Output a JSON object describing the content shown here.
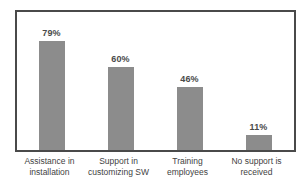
{
  "chart_data": {
    "type": "bar",
    "title": "",
    "subtitle": "",
    "xlabel": "",
    "ylabel": "",
    "ylim": [
      0,
      100
    ],
    "grid": false,
    "legend": false,
    "legend_position": "none",
    "orientation": "vertical",
    "bar_color": "#8c8c8c",
    "frame_color": "#4a4a4a",
    "background_color": "#ffffff",
    "label_color": "#4a4a4a",
    "value_suffix": "%",
    "categories": [
      "Assistance in installation",
      "Support in customizing SW",
      "Training employees",
      "No support is received"
    ],
    "values": [
      79,
      60,
      46,
      11
    ],
    "data_labels": [
      "79%",
      "60%",
      "46%",
      "11%"
    ],
    "points": [
      {
        "category": "Assistance in installation",
        "category_line1": "Assistance in",
        "category_line2": "installation",
        "value": 79,
        "label": "79%"
      },
      {
        "category": "Support in customizing SW",
        "category_line1": "Support in",
        "category_line2": "customizing SW",
        "value": 60,
        "label": "60%"
      },
      {
        "category": "Training employees",
        "category_line1": "Training",
        "category_line2": "employees",
        "value": 46,
        "label": "46%"
      },
      {
        "category": "No support is received",
        "category_line1": "No support is",
        "category_line2": "received",
        "value": 11,
        "label": "11%"
      }
    ]
  }
}
